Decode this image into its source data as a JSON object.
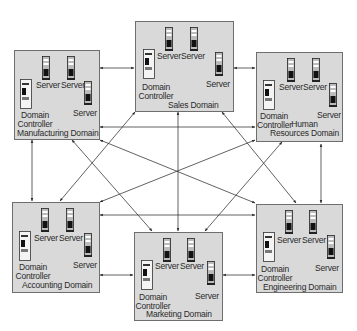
{
  "diagram": {
    "title": "",
    "domains": [
      {
        "id": "manufacturing",
        "name": "Manufacturing Domain",
        "server_label": "Server",
        "dc_label_line1": "Domain",
        "dc_label_line2": "Controller"
      },
      {
        "id": "sales",
        "name": "Sales Domain",
        "server_label": "Server",
        "dc_label_line1": "Domain",
        "dc_label_line2": "Controller"
      },
      {
        "id": "hr",
        "name_line1": "Human",
        "name_line2": "Resources Domain",
        "server_label": "Server",
        "dc_label_line1": "Domain",
        "dc_label_line2": "Controller"
      },
      {
        "id": "accounting",
        "name": "Accounting Domain",
        "server_label": "Server",
        "dc_label_line1": "Domain",
        "dc_label_line2": "Controller"
      },
      {
        "id": "marketing",
        "name": "Marketing Domain",
        "server_label": "Server",
        "dc_label_line1": "Domain",
        "dc_label_line2": "Controller"
      },
      {
        "id": "engineering",
        "name": "Engineering Domain",
        "server_label": "Server",
        "dc_label_line1": "Domain",
        "dc_label_line2": "Controller"
      }
    ],
    "connections": [
      [
        "manufacturing",
        "sales"
      ],
      [
        "manufacturing",
        "hr"
      ],
      [
        "manufacturing",
        "accounting"
      ],
      [
        "manufacturing",
        "marketing"
      ],
      [
        "manufacturing",
        "engineering"
      ],
      [
        "sales",
        "hr"
      ],
      [
        "sales",
        "accounting"
      ],
      [
        "sales",
        "marketing"
      ],
      [
        "sales",
        "engineering"
      ],
      [
        "hr",
        "accounting"
      ],
      [
        "hr",
        "marketing"
      ],
      [
        "hr",
        "engineering"
      ],
      [
        "accounting",
        "marketing"
      ],
      [
        "accounting",
        "engineering"
      ],
      [
        "marketing",
        "engineering"
      ]
    ],
    "colors": {
      "box_fill": "#d9d9d9",
      "box_border": "#6e6e6e",
      "line": "#3a3a3a",
      "text": "#2a2a2a"
    }
  }
}
